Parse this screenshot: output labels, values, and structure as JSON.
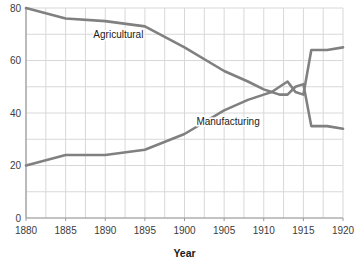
{
  "chart_data": {
    "type": "line",
    "title": "",
    "xlabel": "Year",
    "ylabel": "",
    "xlim": [
      1880,
      1920
    ],
    "ylim": [
      0,
      80
    ],
    "grid": true,
    "legend_position": "inline-annotations",
    "x_ticks": [
      "1880",
      "1885",
      "1890",
      "1895",
      "1900",
      "1905",
      "1910",
      "1915",
      "1920"
    ],
    "y_ticks": [
      "0",
      "20",
      "40",
      "60",
      "80"
    ],
    "x_tick_values": [
      1880,
      1885,
      1890,
      1895,
      1900,
      1905,
      1910,
      1915,
      1920
    ],
    "y_tick_values": [
      0,
      20,
      40,
      60,
      80
    ],
    "y_gridline_values": [
      0,
      10,
      20,
      30,
      40,
      50,
      60,
      70,
      80
    ],
    "x_gridline_values": [
      1880,
      1882.5,
      1885,
      1887.5,
      1890,
      1892.5,
      1895,
      1897.5,
      1900,
      1902.5,
      1905,
      1907.5,
      1910,
      1912.5,
      1915,
      1917.5,
      1920
    ],
    "series": [
      {
        "name": "Agricultural",
        "color": "#808080",
        "x": [
          1880,
          1885,
          1890,
          1895,
          1900,
          1905,
          1908,
          1910,
          1911,
          1912,
          1913,
          1914,
          1915,
          1916,
          1918,
          1920
        ],
        "values": [
          80,
          76,
          75,
          73,
          65,
          56,
          52,
          49,
          48,
          50,
          52,
          48,
          47,
          64,
          64,
          65
        ]
      },
      {
        "name": "Manufacturing",
        "color": "#808080",
        "x": [
          1880,
          1885,
          1890,
          1895,
          1900,
          1905,
          1908,
          1910,
          1911,
          1912,
          1913,
          1914,
          1915,
          1916,
          1918,
          1920
        ],
        "values": [
          20,
          24,
          24,
          26,
          32,
          41,
          45,
          47,
          48,
          47,
          47,
          50,
          51,
          35,
          35,
          34
        ]
      }
    ],
    "annotations": [
      {
        "text": "Agricultural",
        "x": 1888.5,
        "y": 68.5
      },
      {
        "text": "Manufacturing",
        "x": 1901.5,
        "y": 35.5
      }
    ]
  },
  "style": {
    "line_color": "#808080",
    "grid_color": "#d8d8d8",
    "axis_color": "#9a9a9a",
    "text_color": "#3c3c3c",
    "background": "#ffffff"
  }
}
